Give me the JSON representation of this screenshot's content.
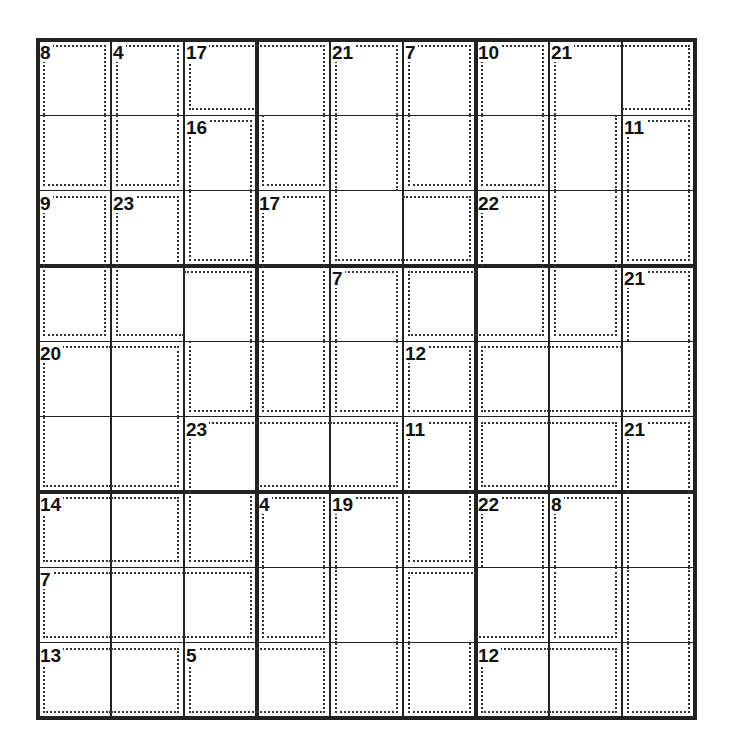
{
  "puzzle": {
    "type": "killer-sudoku",
    "size": 9,
    "cages": [
      {
        "sum": 8,
        "cells": [
          [
            0,
            0
          ],
          [
            1,
            0
          ]
        ]
      },
      {
        "sum": 4,
        "cells": [
          [
            0,
            1
          ],
          [
            1,
            1
          ]
        ]
      },
      {
        "sum": 17,
        "cells": [
          [
            0,
            2
          ],
          [
            0,
            3
          ],
          [
            1,
            3
          ]
        ]
      },
      {
        "sum": 21,
        "cells": [
          [
            0,
            4
          ],
          [
            1,
            4
          ],
          [
            2,
            4
          ],
          [
            2,
            5
          ]
        ]
      },
      {
        "sum": 7,
        "cells": [
          [
            0,
            5
          ],
          [
            1,
            5
          ]
        ]
      },
      {
        "sum": 10,
        "cells": [
          [
            0,
            6
          ],
          [
            1,
            6
          ]
        ]
      },
      {
        "sum": 21,
        "cells": [
          [
            0,
            7
          ],
          [
            0,
            8
          ],
          [
            1,
            7
          ],
          [
            2,
            7
          ],
          [
            3,
            7
          ]
        ]
      },
      {
        "sum": 16,
        "cells": [
          [
            1,
            2
          ],
          [
            2,
            2
          ]
        ]
      },
      {
        "sum": 11,
        "cells": [
          [
            1,
            8
          ],
          [
            2,
            8
          ]
        ]
      },
      {
        "sum": 9,
        "cells": [
          [
            2,
            0
          ],
          [
            3,
            0
          ]
        ]
      },
      {
        "sum": 23,
        "cells": [
          [
            2,
            1
          ],
          [
            3,
            1
          ],
          [
            3,
            2
          ],
          [
            4,
            2
          ]
        ]
      },
      {
        "sum": 17,
        "cells": [
          [
            2,
            3
          ],
          [
            3,
            3
          ],
          [
            4,
            3
          ]
        ]
      },
      {
        "sum": 22,
        "cells": [
          [
            2,
            6
          ],
          [
            3,
            5
          ],
          [
            3,
            6
          ]
        ]
      },
      {
        "sum": 7,
        "cells": [
          [
            3,
            4
          ],
          [
            4,
            4
          ]
        ]
      },
      {
        "sum": 21,
        "cells": [
          [
            3,
            8
          ],
          [
            4,
            6
          ],
          [
            4,
            7
          ],
          [
            4,
            8
          ]
        ]
      },
      {
        "sum": 20,
        "cells": [
          [
            4,
            0
          ],
          [
            4,
            1
          ],
          [
            5,
            0
          ],
          [
            5,
            1
          ]
        ]
      },
      {
        "sum": 12,
        "cells": [
          [
            4,
            5
          ],
          [
            5,
            6
          ],
          [
            5,
            7
          ]
        ]
      },
      {
        "sum": 23,
        "cells": [
          [
            5,
            2
          ],
          [
            5,
            3
          ],
          [
            5,
            4
          ],
          [
            6,
            2
          ]
        ]
      },
      {
        "sum": 11,
        "cells": [
          [
            5,
            5
          ],
          [
            6,
            5
          ]
        ]
      },
      {
        "sum": 21,
        "cells": [
          [
            5,
            8
          ],
          [
            6,
            8
          ],
          [
            7,
            8
          ],
          [
            8,
            8
          ]
        ]
      },
      {
        "sum": 14,
        "cells": [
          [
            6,
            0
          ],
          [
            6,
            1
          ]
        ]
      },
      {
        "sum": 4,
        "cells": [
          [
            6,
            3
          ],
          [
            7,
            3
          ]
        ]
      },
      {
        "sum": 19,
        "cells": [
          [
            6,
            4
          ],
          [
            7,
            4
          ],
          [
            8,
            4
          ]
        ]
      },
      {
        "sum": 22,
        "cells": [
          [
            6,
            6
          ],
          [
            7,
            5
          ],
          [
            8,
            5
          ],
          [
            7,
            6
          ]
        ]
      },
      {
        "sum": 8,
        "cells": [
          [
            6,
            7
          ],
          [
            7,
            7
          ]
        ]
      },
      {
        "sum": 7,
        "cells": [
          [
            7,
            0
          ],
          [
            7,
            1
          ],
          [
            7,
            2
          ]
        ]
      },
      {
        "sum": 13,
        "cells": [
          [
            8,
            0
          ],
          [
            8,
            1
          ]
        ]
      },
      {
        "sum": 5,
        "cells": [
          [
            8,
            2
          ],
          [
            8,
            3
          ]
        ]
      },
      {
        "sum": 12,
        "cells": [
          [
            8,
            6
          ],
          [
            8,
            7
          ]
        ]
      }
    ]
  }
}
